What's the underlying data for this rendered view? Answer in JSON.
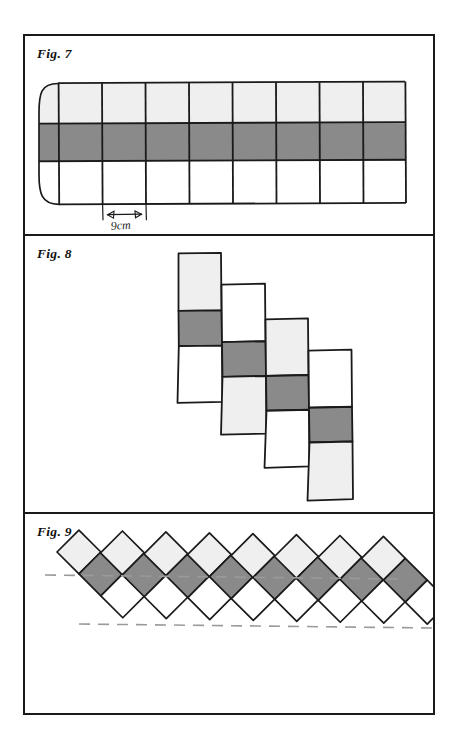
{
  "page": {
    "background": "#ffffff",
    "frame_color": "#1a1a1a",
    "width": 455,
    "height": 747
  },
  "palette": {
    "light_gray": "#efefef",
    "dark_gray": "#8a8a8a",
    "white": "#ffffff",
    "stroke": "#1a1a1a",
    "dash_line": "#9a9a9a"
  },
  "figures": [
    {
      "id": "fig7",
      "label": "Fig. 7",
      "description": "Long horizontal three-row strip of eight square cells with a rolled rounded left end",
      "cell_count": 8,
      "row_colors": [
        "light_gray",
        "dark_gray",
        "white"
      ],
      "left_end": "rolled",
      "right_end": "flat",
      "dimension": {
        "text": "9cm",
        "spans": "one-cell-width",
        "arrow": "double-headed"
      }
    },
    {
      "id": "fig8",
      "label": "Fig. 8",
      "description": "Four overlapping vertical three-cell strips arranged in a descending staircase",
      "strip_count": 4,
      "cells_per_strip": 3,
      "strips": [
        {
          "index": 1,
          "colors": [
            "light_gray",
            "dark_gray",
            "white"
          ]
        },
        {
          "index": 2,
          "colors": [
            "white",
            "dark_gray",
            "light_gray"
          ]
        },
        {
          "index": 3,
          "colors": [
            "light_gray",
            "dark_gray",
            "white"
          ]
        },
        {
          "index": 4,
          "colors": [
            "white",
            "dark_gray",
            "light_gray"
          ]
        }
      ]
    },
    {
      "id": "fig9",
      "label": "Fig. 9",
      "description": "Eight overlapping three-cell strips rotated forty-five degrees forming a diamond lattice, with two horizontal dashed guide lines",
      "strip_count": 8,
      "cells_per_strip": 3,
      "rotation_degrees": 45,
      "guide_lines": 2,
      "strip_colors": [
        "light_gray",
        "dark_gray",
        "white"
      ]
    }
  ]
}
